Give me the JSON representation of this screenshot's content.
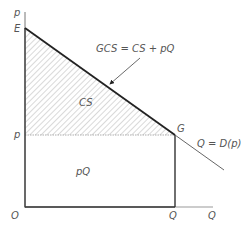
{
  "diagram": {
    "type": "economics-consumer-surplus",
    "axes": {
      "y_label": "p",
      "x_label": "Q",
      "origin_label": "O"
    },
    "points": {
      "E": "E",
      "G": "G",
      "p_tick": "p",
      "Q_tick": "Q"
    },
    "regions": {
      "consumer_surplus": "CS",
      "revenue": "pQ"
    },
    "annotations": {
      "gcs_formula": "GCS = CS + pQ",
      "demand_curve": "Q = D(p)"
    },
    "colors": {
      "line": "#222222",
      "hatch": "#9a9a9a",
      "text": "#555555",
      "axis": "#777777"
    }
  }
}
